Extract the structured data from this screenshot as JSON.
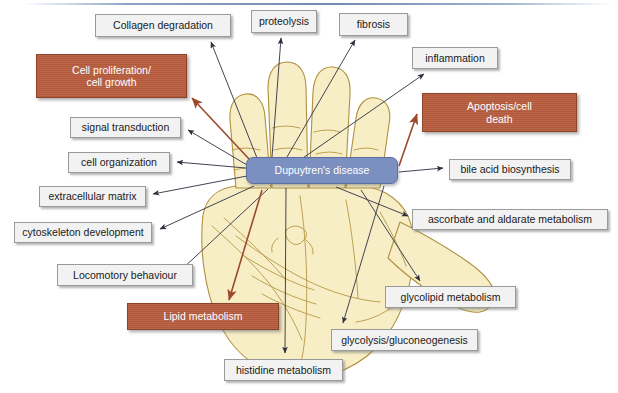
{
  "figure": {
    "type": "concept-network-diagram",
    "center_label": "Dupuytren's disease",
    "background_image": "hand-palm-illustration",
    "colors": {
      "highlight_box": "#b3593a",
      "plain_box": "#f2f2f2",
      "plain_box_border": "#9a9a9a",
      "center_node": "#7b8fc0",
      "highlight_edge": "#9c4a2e",
      "plain_edge": "#3a3a4a",
      "hand_fill": "#f6edc4",
      "hand_outline": "#a8853f",
      "top_rule": "#6f8bb0"
    },
    "top_rule_visible": true
  },
  "nodes": [
    {
      "id": "collagen-degradation",
      "label": "Collagen degradation",
      "style": "plain",
      "x": 95,
      "y": 14,
      "w": 136,
      "h": 23
    },
    {
      "id": "proteolysis",
      "label": "proteolysis",
      "style": "plain",
      "x": 251,
      "y": 10,
      "w": 66,
      "h": 23
    },
    {
      "id": "fibrosis",
      "label": "fibrosis",
      "style": "plain",
      "x": 339,
      "y": 13,
      "w": 69,
      "h": 23
    },
    {
      "id": "inflammation",
      "label": "inflammation",
      "style": "plain",
      "x": 412,
      "y": 47,
      "w": 86,
      "h": 22
    },
    {
      "id": "cell-proliferation",
      "label": "Cell proliferation/\ncell growth",
      "style": "highlight",
      "x": 36,
      "y": 54,
      "w": 151,
      "h": 44
    },
    {
      "id": "apoptosis",
      "label": "Apoptosis/cell\ndeath",
      "style": "highlight",
      "x": 422,
      "y": 93,
      "w": 155,
      "h": 39
    },
    {
      "id": "signal-transduction",
      "label": "signal transduction",
      "style": "plain",
      "x": 70,
      "y": 117,
      "w": 111,
      "h": 21
    },
    {
      "id": "cell-organization",
      "label": "cell organization",
      "style": "plain",
      "x": 68,
      "y": 152,
      "w": 102,
      "h": 21
    },
    {
      "id": "dupuytrens-disease",
      "label": "Dupuytren's disease",
      "style": "center",
      "x": 246,
      "y": 157,
      "w": 152,
      "h": 27
    },
    {
      "id": "bile-acid-biosynthesis",
      "label": "bile acid biosynthesis",
      "style": "plain",
      "x": 449,
      "y": 159,
      "w": 122,
      "h": 21
    },
    {
      "id": "extracellular-matrix",
      "label": "extracellular matrix",
      "style": "plain",
      "x": 39,
      "y": 186,
      "w": 107,
      "h": 21
    },
    {
      "id": "ascorbate-aldarate",
      "label": "ascorbate and aldarate metabolism",
      "style": "plain",
      "x": 412,
      "y": 209,
      "w": 196,
      "h": 21
    },
    {
      "id": "cytoskeleton",
      "label": "cytoskeleton development",
      "style": "plain",
      "x": 14,
      "y": 222,
      "w": 138,
      "h": 21
    },
    {
      "id": "locomotory-behaviour",
      "label": "Locomotory behaviour",
      "style": "plain",
      "x": 57,
      "y": 264,
      "w": 136,
      "h": 22
    },
    {
      "id": "glycolipid-metabolism",
      "label": "glycolipid metabolism",
      "style": "plain",
      "x": 385,
      "y": 286,
      "w": 131,
      "h": 22
    },
    {
      "id": "lipid-metabolism",
      "label": "Lipid metabolism",
      "style": "highlight",
      "x": 127,
      "y": 303,
      "w": 152,
      "h": 27
    },
    {
      "id": "glycolysis-gluconeo",
      "label": "glycolysis/gluconeogenesis",
      "style": "plain",
      "x": 331,
      "y": 329,
      "w": 147,
      "h": 22
    },
    {
      "id": "histidine-metabolism",
      "label": "histidine metabolism",
      "style": "plain",
      "x": 224,
      "y": 359,
      "w": 119,
      "h": 22
    }
  ],
  "edges": [
    {
      "from": "dupuytrens-disease",
      "to": "collagen-degradation",
      "type": "plain"
    },
    {
      "from": "dupuytrens-disease",
      "to": "proteolysis",
      "type": "plain"
    },
    {
      "from": "dupuytrens-disease",
      "to": "fibrosis",
      "type": "plain"
    },
    {
      "from": "dupuytrens-disease",
      "to": "inflammation",
      "type": "plain"
    },
    {
      "from": "dupuytrens-disease",
      "to": "cell-proliferation",
      "type": "highlight"
    },
    {
      "from": "dupuytrens-disease",
      "to": "apoptosis",
      "type": "highlight"
    },
    {
      "from": "dupuytrens-disease",
      "to": "signal-transduction",
      "type": "plain"
    },
    {
      "from": "dupuytrens-disease",
      "to": "cell-organization",
      "type": "plain"
    },
    {
      "from": "dupuytrens-disease",
      "to": "extracellular-matrix",
      "type": "plain"
    },
    {
      "from": "dupuytrens-disease",
      "to": "cytoskeleton",
      "type": "plain"
    },
    {
      "from": "dupuytrens-disease",
      "to": "locomotory-behaviour",
      "type": "plain"
    },
    {
      "from": "dupuytrens-disease",
      "to": "bile-acid-biosynthesis",
      "type": "plain"
    },
    {
      "from": "dupuytrens-disease",
      "to": "ascorbate-aldarate",
      "type": "plain"
    },
    {
      "from": "dupuytrens-disease",
      "to": "glycolipid-metabolism",
      "type": "plain"
    },
    {
      "from": "dupuytrens-disease",
      "to": "glycolysis-gluconeo",
      "type": "plain"
    },
    {
      "from": "dupuytrens-disease",
      "to": "lipid-metabolism",
      "type": "highlight"
    },
    {
      "from": "dupuytrens-disease",
      "to": "histidine-metabolism",
      "type": "plain"
    }
  ]
}
